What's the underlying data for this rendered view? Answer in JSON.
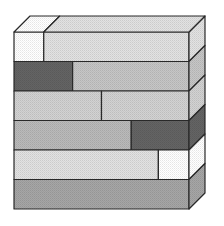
{
  "diagram": {
    "title": "",
    "colors": {
      "outline": "#2a2a2a",
      "white": "#ffffff",
      "light_dotted": "#e2e2e2",
      "light": "#d2d2d2",
      "medium_light": "#c6c6c6",
      "medium": "#bababa",
      "medium_dark": "#a6a6a6",
      "dark": "#646464"
    },
    "rows": [
      {
        "name": "row-1-top",
        "blocks": [
          {
            "name": "white-block",
            "start": 0,
            "end": 0.17,
            "shade": "white"
          },
          {
            "name": "light-dotted-block",
            "start": 0.17,
            "end": 1.0,
            "shade": "light_dotted"
          }
        ],
        "side_shade": "light_dotted"
      },
      {
        "name": "row-2",
        "blocks": [
          {
            "name": "dark-block",
            "start": 0,
            "end": 0.335,
            "shade": "dark"
          },
          {
            "name": "medium-light-block",
            "start": 0.335,
            "end": 1.0,
            "shade": "medium_light"
          }
        ],
        "side_shade": "medium_light"
      },
      {
        "name": "row-3",
        "blocks": [
          {
            "name": "light-block-left",
            "start": 0,
            "end": 0.5,
            "shade": "light"
          },
          {
            "name": "light-block-right",
            "start": 0.5,
            "end": 1.0,
            "shade": "light"
          }
        ],
        "side_shade": "light"
      },
      {
        "name": "row-4",
        "blocks": [
          {
            "name": "medium-block",
            "start": 0,
            "end": 0.67,
            "shade": "medium"
          },
          {
            "name": "dark-block",
            "start": 0.67,
            "end": 1.0,
            "shade": "dark"
          }
        ],
        "side_shade": "dark"
      },
      {
        "name": "row-5",
        "blocks": [
          {
            "name": "light-dotted-block",
            "start": 0,
            "end": 0.825,
            "shade": "light_dotted"
          },
          {
            "name": "white-block",
            "start": 0.825,
            "end": 1.0,
            "shade": "white"
          }
        ],
        "side_shade": "white"
      },
      {
        "name": "row-6-bottom",
        "blocks": [
          {
            "name": "medium-dark-block",
            "start": 0,
            "end": 1.0,
            "shade": "medium_dark"
          }
        ],
        "side_shade": "medium_dark"
      }
    ],
    "top_blocks": [
      {
        "name": "top-white-block",
        "start": 0,
        "end": 0.17,
        "shade": "white"
      },
      {
        "name": "top-light-dotted-block",
        "start": 0.17,
        "end": 1.0,
        "shade": "light_dotted"
      }
    ]
  }
}
